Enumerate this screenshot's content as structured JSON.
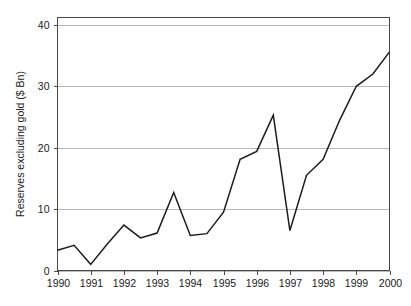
{
  "chart_data": {
    "type": "line",
    "title": "",
    "xlabel": "",
    "ylabel": "Reserves excluding gold ($ Bn)",
    "xlim": [
      1990,
      2000
    ],
    "ylim": [
      0,
      41.2
    ],
    "grid": true,
    "legend_position": "none",
    "yticks": [
      0,
      10,
      20,
      30,
      40
    ],
    "ytick_labels": [
      "0",
      "10",
      "20",
      "30",
      "40"
    ],
    "xticks": [
      1990,
      1991,
      1992,
      1993,
      1994,
      1995,
      1996,
      1997,
      1998,
      1999,
      2000
    ],
    "xtick_labels": [
      "1990",
      "1991",
      "1992",
      "1993",
      "1994",
      "1995",
      "1996",
      "1997",
      "1998",
      "1999",
      "2000"
    ],
    "series": [
      {
        "name": "Reserves excluding gold",
        "color": "#1c1c1c",
        "x": [
          1990.0,
          1990.5,
          1991.0,
          1991.5,
          1992.0,
          1992.5,
          1993.0,
          1993.5,
          1994.0,
          1994.5,
          1995.0,
          1995.5,
          1996.0,
          1996.5,
          1997.0,
          1997.5,
          1998.0,
          1998.5,
          1999.0,
          1999.5,
          2000.0
        ],
        "y": [
          3.3,
          4.1,
          1.0,
          4.3,
          7.4,
          5.3,
          6.1,
          12.7,
          5.7,
          6.0,
          9.5,
          18.1,
          19.4,
          25.3,
          6.5,
          15.5,
          18.1,
          24.5,
          30.0,
          32.0,
          35.6
        ]
      }
    ]
  },
  "axis": {
    "ylabel": "Reserves excluding gold ($ Bn)"
  }
}
